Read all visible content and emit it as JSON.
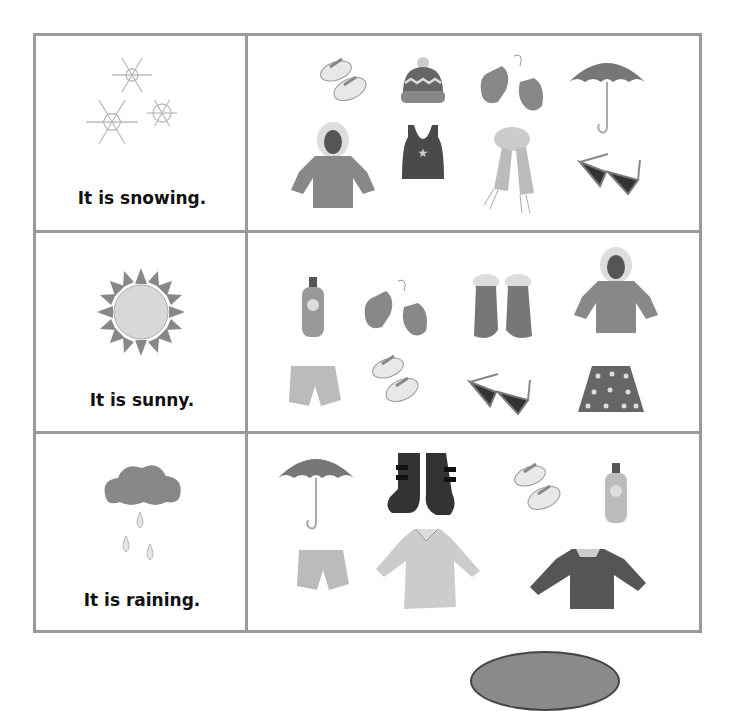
{
  "rows": [
    {
      "weather": "snowing",
      "weather_icon": "snowflakes-icon",
      "label": "It is snowing.",
      "items": [
        {
          "name": "flip-flops",
          "icon": "flip-flops-icon"
        },
        {
          "name": "knit hat",
          "icon": "knit-hat-icon"
        },
        {
          "name": "mittens",
          "icon": "mittens-icon"
        },
        {
          "name": "umbrella",
          "icon": "umbrella-icon"
        },
        {
          "name": "winter coat",
          "icon": "winter-coat-icon"
        },
        {
          "name": "tank top",
          "icon": "tank-top-icon"
        },
        {
          "name": "scarf",
          "icon": "scarf-icon"
        },
        {
          "name": "sunglasses",
          "icon": "sunglasses-icon"
        }
      ]
    },
    {
      "weather": "sunny",
      "weather_icon": "sun-icon",
      "label": "It is sunny.",
      "items": [
        {
          "name": "sunscreen",
          "icon": "sunscreen-bottle-icon"
        },
        {
          "name": "mittens",
          "icon": "mittens-icon"
        },
        {
          "name": "snow boots",
          "icon": "snow-boots-icon"
        },
        {
          "name": "winter coat",
          "icon": "winter-coat-icon"
        },
        {
          "name": "shorts",
          "icon": "shorts-icon"
        },
        {
          "name": "flip-flops",
          "icon": "flip-flops-icon"
        },
        {
          "name": "sunglasses",
          "icon": "sunglasses-icon"
        },
        {
          "name": "skirt",
          "icon": "polka-dot-skirt-icon"
        }
      ]
    },
    {
      "weather": "raining",
      "weather_icon": "rain-cloud-icon",
      "label": "It is raining.",
      "items": [
        {
          "name": "umbrella",
          "icon": "umbrella-icon"
        },
        {
          "name": "rain boots",
          "icon": "rain-boots-icon"
        },
        {
          "name": "flip-flops",
          "icon": "flip-flops-icon"
        },
        {
          "name": "sunscreen",
          "icon": "sunscreen-bottle-icon"
        },
        {
          "name": "shorts",
          "icon": "shorts-icon"
        },
        {
          "name": "raincoat",
          "icon": "raincoat-icon"
        },
        {
          "name": "sweater",
          "icon": "sweater-icon"
        }
      ]
    }
  ],
  "colors": {
    "grid_line": "#9a9a9a",
    "text": "#111111"
  }
}
